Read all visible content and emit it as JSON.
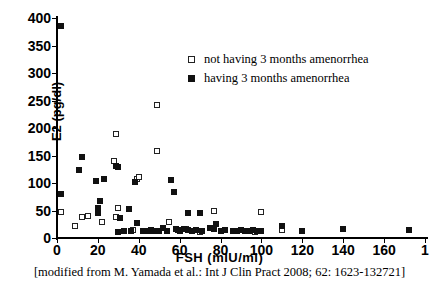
{
  "chart_data": {
    "type": "scatter",
    "title": "",
    "xlabel": "FSH (mIU/ml)",
    "ylabel": "E2 (pg/dl)",
    "xlim": [
      0,
      180
    ],
    "ylim": [
      0,
      400
    ],
    "xticks": [
      0,
      20,
      40,
      60,
      80,
      100,
      120,
      140,
      160,
      180
    ],
    "xticklabels": [
      "0",
      "20",
      "40",
      "60",
      "80",
      "100",
      "120",
      "140",
      "160",
      "1"
    ],
    "yticks": [
      0,
      50,
      100,
      150,
      200,
      250,
      300,
      350,
      400
    ],
    "yticklabels": [
      "0",
      "50",
      "100",
      "150",
      "200",
      "250",
      "300",
      "350",
      "400"
    ],
    "grid": false,
    "legend_position": "upper-center-right",
    "marker_colors": {
      "open": "#ffffff",
      "open_edge": "#222222",
      "filled": "#111111"
    },
    "series": [
      {
        "name": "not having 3 months amenorrhea",
        "marker": "open-square",
        "points": [
          [
            2,
            48
          ],
          [
            9,
            22
          ],
          [
            12,
            39
          ],
          [
            15,
            40
          ],
          [
            22,
            30
          ],
          [
            28,
            140
          ],
          [
            29,
            189
          ],
          [
            29,
            38
          ],
          [
            30,
            55
          ],
          [
            37,
            14
          ],
          [
            39,
            108
          ],
          [
            40,
            111
          ],
          [
            49,
            241
          ],
          [
            49,
            158
          ],
          [
            55,
            30
          ],
          [
            63,
            16
          ],
          [
            66,
            13
          ],
          [
            70,
            11
          ],
          [
            77,
            49
          ],
          [
            97,
            11
          ],
          [
            100,
            47
          ],
          [
            110,
            14
          ]
        ]
      },
      {
        "name": "having 3 months amenorrhea",
        "marker": "filled-square",
        "points": [
          [
            2,
            385
          ],
          [
            2,
            80
          ],
          [
            11,
            124
          ],
          [
            12,
            147
          ],
          [
            19,
            104
          ],
          [
            20,
            54
          ],
          [
            20,
            46
          ],
          [
            21,
            68
          ],
          [
            23,
            108
          ],
          [
            29,
            131
          ],
          [
            30,
            129
          ],
          [
            30,
            11
          ],
          [
            31,
            37
          ],
          [
            33,
            12
          ],
          [
            35,
            53
          ],
          [
            36,
            13
          ],
          [
            38,
            101
          ],
          [
            39,
            27
          ],
          [
            42,
            13
          ],
          [
            44,
            12
          ],
          [
            46,
            15
          ],
          [
            47,
            12
          ],
          [
            50,
            13
          ],
          [
            52,
            18
          ],
          [
            54,
            12
          ],
          [
            56,
            105
          ],
          [
            57,
            84
          ],
          [
            58,
            16
          ],
          [
            59,
            14
          ],
          [
            60,
            13
          ],
          [
            62,
            17
          ],
          [
            64,
            45
          ],
          [
            64,
            14
          ],
          [
            66,
            12
          ],
          [
            68,
            15
          ],
          [
            70,
            45
          ],
          [
            71,
            13
          ],
          [
            75,
            19
          ],
          [
            77,
            16
          ],
          [
            78,
            26
          ],
          [
            80,
            12
          ],
          [
            82,
            14
          ],
          [
            86,
            13
          ],
          [
            88,
            12
          ],
          [
            90,
            15
          ],
          [
            92,
            12
          ],
          [
            94,
            13
          ],
          [
            96,
            14
          ],
          [
            98,
            12
          ],
          [
            100,
            13
          ],
          [
            110,
            22
          ],
          [
            120,
            13
          ],
          [
            140,
            16
          ],
          [
            172,
            15
          ]
        ]
      }
    ]
  },
  "legend": {
    "entries": [
      {
        "label": "not having 3 months amenorrhea",
        "marker": "open-square"
      },
      {
        "label": "having 3 months amenorrhea",
        "marker": "filled-square"
      }
    ]
  },
  "caption": {
    "text": "[modified from M. Yamada et al.: Int J Clin Pract 2008; 62: 1623-132721]"
  }
}
